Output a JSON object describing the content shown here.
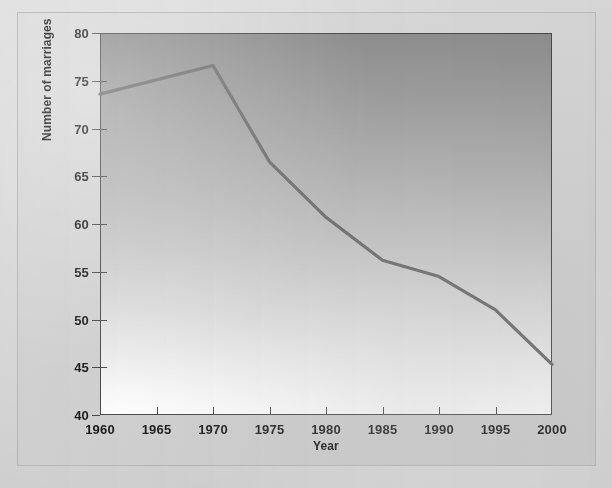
{
  "figure": {
    "panel_bg": "#d4d4d4",
    "plot_border_color": "#4a4a4a",
    "line_color": "#6e6e6e"
  },
  "chart_data": {
    "type": "line",
    "title": "",
    "subtitle": "",
    "xlabel": "Year",
    "ylabel": "Number of marriages",
    "x": [
      1960,
      1970,
      1975,
      1980,
      1985,
      1990,
      1995,
      2000
    ],
    "values": [
      73.6,
      76.6,
      66.5,
      60.7,
      56.2,
      54.5,
      51.0,
      45.3
    ],
    "series": [
      {
        "name": "Number of marriages",
        "x": [
          1960,
          1970,
          1975,
          1980,
          1985,
          1990,
          1995,
          2000
        ],
        "values": [
          73.6,
          76.6,
          66.5,
          60.7,
          56.2,
          54.5,
          51.0,
          45.3
        ]
      }
    ],
    "xlim": [
      1960,
      2000
    ],
    "ylim": [
      40,
      80
    ],
    "xticks": [
      1960,
      1965,
      1970,
      1975,
      1980,
      1985,
      1990,
      1995,
      2000
    ],
    "yticks": [
      40,
      45,
      50,
      55,
      60,
      65,
      70,
      75,
      80
    ],
    "xtick_labels": [
      "1960",
      "1965",
      "1970",
      "1975",
      "1980",
      "1985",
      "1990",
      "1995",
      "2000"
    ],
    "ytick_labels": [
      "40",
      "45",
      "50",
      "55",
      "60",
      "65",
      "70",
      "75",
      "80"
    ],
    "grid": false,
    "legend": false,
    "legend_position": "none",
    "annotations": []
  }
}
